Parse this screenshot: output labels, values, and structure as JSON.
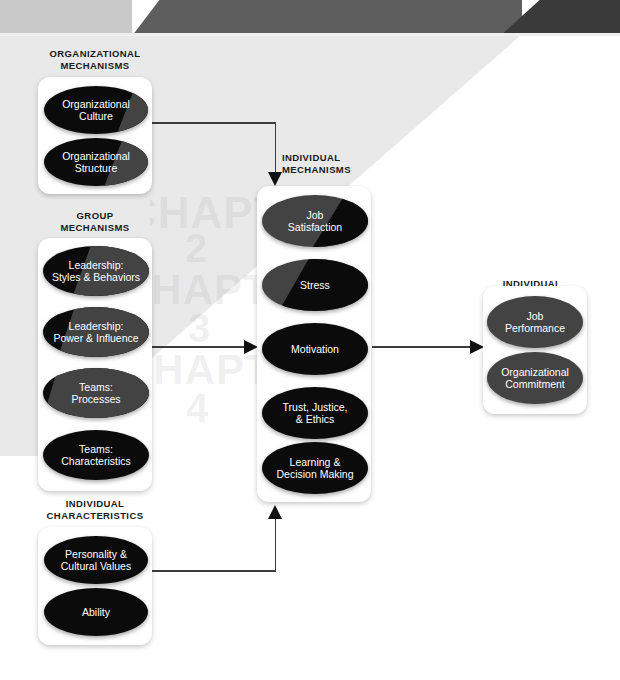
{
  "banner": {
    "segments": [
      {
        "name": "banner-left-light",
        "color": "#c9c9c9"
      },
      {
        "name": "banner-mid-gray",
        "color": "#5e5e5e"
      },
      {
        "name": "banner-right-dark",
        "color": "#3a3a3a"
      }
    ]
  },
  "colors": {
    "node_black": "#0b0b0b",
    "node_gray": "#434343",
    "box_white": "#ffffff",
    "wash_gray": "#e8e8e8",
    "connector": "#3c3c3c",
    "title_text": "#1a1a1a"
  },
  "watermark": {
    "lines": [
      "CHAPTER",
      "2",
      "CHAPTER",
      "3",
      "CHAPTER",
      "4"
    ]
  },
  "groups": [
    {
      "id": "organizational-mechanisms",
      "title": "ORGANIZATIONAL\nMECHANISMS",
      "nodes": [
        {
          "label": "Organizational\nCulture"
        },
        {
          "label": "Organizational\nStructure"
        }
      ]
    },
    {
      "id": "group-mechanisms",
      "title": "GROUP\nMECHANISMS",
      "nodes": [
        {
          "label": "Leadership:\nStyles & Behaviors"
        },
        {
          "label": "Leadership:\nPower & Influence"
        },
        {
          "label": "Teams:\nProcesses"
        },
        {
          "label": "Teams:\nCharacteristics"
        }
      ]
    },
    {
      "id": "individual-characteristics",
      "title": "INDIVIDUAL\nCHARACTERISTICS",
      "nodes": [
        {
          "label": "Personality  &\nCultural Values"
        },
        {
          "label": "Ability"
        }
      ]
    },
    {
      "id": "individual-mechanisms",
      "title": "INDIVIDUAL\nMECHANISMS",
      "nodes": [
        {
          "label": "Job\nSatisfaction"
        },
        {
          "label": "Stress"
        },
        {
          "label": "Motivation"
        },
        {
          "label": "Trust, Justice,\n& Ethics"
        },
        {
          "label": "Learning &\nDecision Making"
        }
      ]
    },
    {
      "id": "individual-outcomes",
      "title": "INDIVIDUAL\nOUTCOMES",
      "nodes": [
        {
          "label": "Job\nPerformance"
        },
        {
          "label": "Organizational\nCommitment"
        }
      ]
    }
  ]
}
